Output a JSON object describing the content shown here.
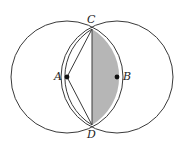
{
  "figure": {
    "width": 182,
    "height": 143,
    "background": "#ffffff",
    "stroke_color": "#3a3a3a",
    "shade_color": "#a9a9a9",
    "shade_opacity": 0.85,
    "point_color": "#111111"
  },
  "circles": [
    {
      "name": "circle-a",
      "center_label": "A",
      "cx": 67,
      "cy": 77,
      "r": 56
    },
    {
      "name": "circle-b",
      "center_label": "B",
      "cx": 117,
      "cy": 77,
      "r": 56
    }
  ],
  "points": [
    {
      "id": "A",
      "label": "A",
      "x": 67,
      "y": 77,
      "label_x": 54,
      "label_y": 71,
      "dot": true
    },
    {
      "id": "B",
      "label": "B",
      "x": 117,
      "y": 77,
      "label_x": 123,
      "label_y": 71,
      "dot": true
    },
    {
      "id": "C",
      "label": "C",
      "x": 92,
      "y": 29,
      "label_x": 87,
      "label_y": 14,
      "dot": false
    },
    {
      "id": "D",
      "label": "D",
      "x": 92,
      "y": 125,
      "label_x": 87,
      "label_y": 129,
      "dot": false
    }
  ],
  "segments": [
    {
      "name": "segment-ac",
      "from": "A",
      "to": "C",
      "x1": 67,
      "y1": 77,
      "x2": 92,
      "y2": 29
    },
    {
      "name": "segment-ad",
      "from": "A",
      "to": "D",
      "x1": 67,
      "y1": 77,
      "x2": 92,
      "y2": 125
    },
    {
      "name": "chord-cd",
      "from": "C",
      "to": "D",
      "x1": 92,
      "y1": 29,
      "x2": 92,
      "y2": 125
    }
  ],
  "arcs": [
    {
      "name": "arc-b-left-through-c-d",
      "of_circle": "circle-b",
      "from": "C",
      "to": "D",
      "path": "M 92 29 A 56 56 0 0 0 92 125"
    }
  ],
  "shaded_region": {
    "name": "lens-segment-shaded",
    "description": "Circular segment of circle A to the right of chord CD",
    "path": "M 92 29 A 56 56 0 0 1 92 125 L 92 29 Z"
  }
}
